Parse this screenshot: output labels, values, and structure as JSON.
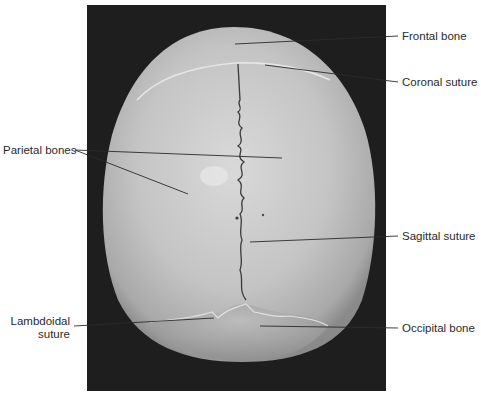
{
  "figure": {
    "background_color": "#ffffff",
    "photo_background": "#1e1e1e",
    "bone_color": "#c8c8c8",
    "leader_line_color": "#2a2a2a"
  },
  "labels": {
    "frontal_bone": "Frontal bone",
    "coronal_suture": "Coronal suture",
    "parietal_bones": "Parietal bones",
    "sagittal_suture": "Sagittal suture",
    "lambdoidal_suture_line1": "Lambdoidal",
    "lambdoidal_suture_line2": "suture",
    "occipital_bone": "Occipital bone"
  }
}
